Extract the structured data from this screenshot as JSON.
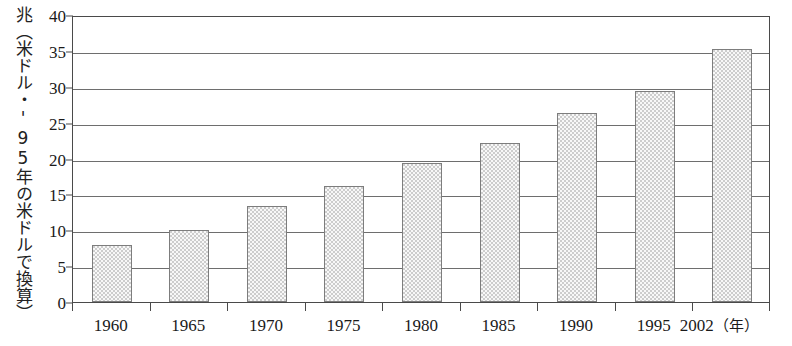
{
  "chart_data": {
    "type": "bar",
    "title": "",
    "subtitle": "",
    "xlabel": "年",
    "ylabel": "兆（米ドル・'95年の米ドルで換算）",
    "categories": [
      "1960",
      "1965",
      "1970",
      "1975",
      "1980",
      "1985",
      "1990",
      "1995",
      "2002"
    ],
    "values": [
      7.9,
      10.1,
      13.4,
      16.2,
      19.4,
      22.1,
      26.3,
      29.4,
      35.3
    ],
    "series": [
      {
        "name": "世界の国内総生産",
        "values": [
          7.9,
          10.1,
          13.4,
          16.2,
          19.4,
          22.1,
          26.3,
          29.4,
          35.3
        ]
      }
    ],
    "ylim": [
      0,
      40
    ],
    "yticks": [
      0,
      5,
      10,
      15,
      20,
      25,
      30,
      35,
      40
    ],
    "ytick_labels": [
      "0",
      "5",
      "10",
      "15",
      "20",
      "25",
      "30",
      "35",
      "40"
    ],
    "grid": true,
    "grid_axis": "y",
    "legend": false,
    "legend_position": "none",
    "bar_fill_color": "#cdcdcd",
    "bar_edge_color": "#7d7d7d",
    "frame_color": "#4a4a4a",
    "grid_color": "#6e6e6e",
    "background_color": "#ffffff"
  },
  "axis": {
    "y_caption": "兆（米ドル・'95年の米ドルで換算）",
    "x_unit_label": "（年）"
  }
}
